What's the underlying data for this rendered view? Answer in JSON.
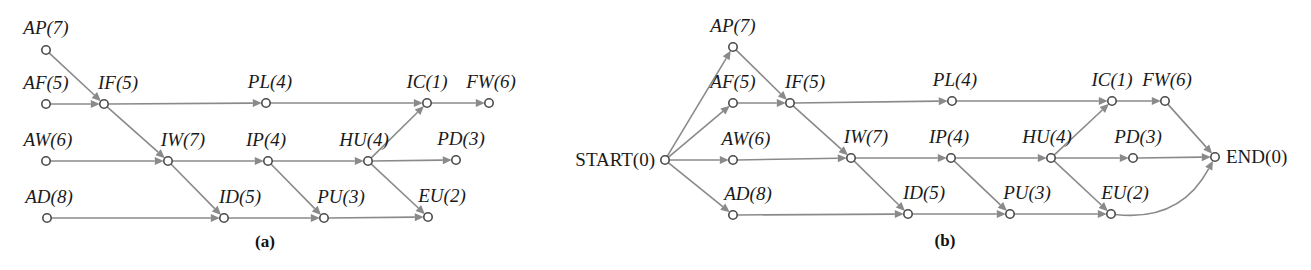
{
  "figure": {
    "background_color": "#ffffff",
    "edge_color": "#8a8a8a",
    "node_stroke_color": "#4a4a4a",
    "text_color": "#1a1a1a"
  },
  "chart_data": {
    "type": "diagram",
    "panels": [
      {
        "caption": "(a)",
        "caption_x": 265,
        "caption_y": 247,
        "nodes": [
          {
            "id": "AP_a",
            "label": "AP(7)",
            "name": "AP",
            "duration": 7,
            "x": 46,
            "y": 50,
            "label_x": 46,
            "label_y": 34,
            "anchor": "middle",
            "italic": true
          },
          {
            "id": "AF_a",
            "label": "AF(5)",
            "name": "AF",
            "duration": 5,
            "x": 46,
            "y": 104,
            "label_x": 46,
            "label_y": 89,
            "anchor": "middle",
            "italic": true
          },
          {
            "id": "IF_a",
            "label": "IF(5)",
            "name": "IF",
            "duration": 5,
            "x": 104,
            "y": 104,
            "label_x": 118,
            "label_y": 89,
            "anchor": "middle",
            "italic": true
          },
          {
            "id": "PL_a",
            "label": "PL(4)",
            "name": "PL",
            "duration": 4,
            "x": 266,
            "y": 103,
            "label_x": 270,
            "label_y": 88,
            "anchor": "middle",
            "italic": true
          },
          {
            "id": "IC_a",
            "label": "IC(1)",
            "name": "IC",
            "duration": 1,
            "x": 427,
            "y": 103,
            "label_x": 427,
            "label_y": 88,
            "anchor": "middle",
            "italic": true
          },
          {
            "id": "FW_a",
            "label": "FW(6)",
            "name": "FW",
            "duration": 6,
            "x": 489,
            "y": 103,
            "label_x": 491,
            "label_y": 88,
            "anchor": "middle",
            "italic": true
          },
          {
            "id": "AW_a",
            "label": "AW(6)",
            "name": "AW",
            "duration": 6,
            "x": 46,
            "y": 161,
            "label_x": 48,
            "label_y": 146,
            "anchor": "middle",
            "italic": true
          },
          {
            "id": "IW_a",
            "label": "IW(7)",
            "name": "IW",
            "duration": 7,
            "x": 168,
            "y": 161,
            "label_x": 183,
            "label_y": 146,
            "anchor": "middle",
            "italic": true
          },
          {
            "id": "IP_a",
            "label": "IP(4)",
            "name": "IP",
            "duration": 4,
            "x": 268,
            "y": 161,
            "label_x": 266,
            "label_y": 146,
            "anchor": "middle",
            "italic": true
          },
          {
            "id": "HU_a",
            "label": "HU(4)",
            "name": "HU",
            "duration": 4,
            "x": 368,
            "y": 161,
            "label_x": 364,
            "label_y": 146,
            "anchor": "middle",
            "italic": true
          },
          {
            "id": "PD_a",
            "label": "PD(3)",
            "name": "PD",
            "duration": 3,
            "x": 456,
            "y": 160,
            "label_x": 461,
            "label_y": 145,
            "anchor": "middle",
            "italic": true
          },
          {
            "id": "AD_a",
            "label": "AD(8)",
            "name": "AD",
            "duration": 8,
            "x": 47,
            "y": 218,
            "label_x": 49,
            "label_y": 203,
            "anchor": "middle",
            "italic": true
          },
          {
            "id": "ID_a",
            "label": "ID(5)",
            "name": "ID",
            "duration": 5,
            "x": 224,
            "y": 218,
            "label_x": 240,
            "label_y": 203,
            "anchor": "middle",
            "italic": true
          },
          {
            "id": "PU_a",
            "label": "PU(3)",
            "name": "PU",
            "duration": 3,
            "x": 324,
            "y": 218,
            "label_x": 341,
            "label_y": 203,
            "anchor": "middle",
            "italic": true
          },
          {
            "id": "EU_a",
            "label": "EU(2)",
            "name": "EU",
            "duration": 2,
            "x": 428,
            "y": 217,
            "label_x": 442,
            "label_y": 202,
            "anchor": "middle",
            "italic": true
          }
        ],
        "edges": [
          {
            "from": "AP_a",
            "to": "IF_a"
          },
          {
            "from": "AF_a",
            "to": "IF_a"
          },
          {
            "from": "IF_a",
            "to": "PL_a"
          },
          {
            "from": "PL_a",
            "to": "IC_a"
          },
          {
            "from": "IC_a",
            "to": "FW_a"
          },
          {
            "from": "IF_a",
            "to": "IW_a"
          },
          {
            "from": "AW_a",
            "to": "IW_a"
          },
          {
            "from": "IW_a",
            "to": "IP_a"
          },
          {
            "from": "IP_a",
            "to": "HU_a"
          },
          {
            "from": "HU_a",
            "to": "PD_a"
          },
          {
            "from": "HU_a",
            "to": "IC_a"
          },
          {
            "from": "IW_a",
            "to": "ID_a"
          },
          {
            "from": "AD_a",
            "to": "ID_a"
          },
          {
            "from": "ID_a",
            "to": "PU_a"
          },
          {
            "from": "IP_a",
            "to": "PU_a"
          },
          {
            "from": "PU_a",
            "to": "EU_a"
          },
          {
            "from": "HU_a",
            "to": "EU_a"
          }
        ]
      },
      {
        "caption": "(b)",
        "caption_x": 945,
        "caption_y": 246,
        "nodes": [
          {
            "id": "START_b",
            "label": "START(0)",
            "name": "START",
            "duration": 0,
            "x": 665,
            "y": 160,
            "label_x": 655,
            "label_y": 166,
            "anchor": "end",
            "italic": false
          },
          {
            "id": "AP_b",
            "label": "AP(7)",
            "name": "AP",
            "duration": 7,
            "x": 733,
            "y": 47,
            "label_x": 733,
            "label_y": 32,
            "anchor": "middle",
            "italic": true
          },
          {
            "id": "AF_b",
            "label": "AF(5)",
            "name": "AF",
            "duration": 5,
            "x": 733,
            "y": 103,
            "label_x": 733,
            "label_y": 88,
            "anchor": "middle",
            "italic": true
          },
          {
            "id": "IF_b",
            "label": "IF(5)",
            "name": "IF",
            "duration": 5,
            "x": 790,
            "y": 103,
            "label_x": 805,
            "label_y": 88,
            "anchor": "middle",
            "italic": true
          },
          {
            "id": "PL_b",
            "label": "PL(4)",
            "name": "PL",
            "duration": 4,
            "x": 952,
            "y": 101,
            "label_x": 955,
            "label_y": 86,
            "anchor": "middle",
            "italic": true
          },
          {
            "id": "IC_b",
            "label": "IC(1)",
            "name": "IC",
            "duration": 1,
            "x": 1112,
            "y": 101,
            "label_x": 1112,
            "label_y": 86,
            "anchor": "middle",
            "italic": true
          },
          {
            "id": "FW_b",
            "label": "FW(6)",
            "name": "FW",
            "duration": 6,
            "x": 1165,
            "y": 101,
            "label_x": 1167,
            "label_y": 86,
            "anchor": "middle",
            "italic": true
          },
          {
            "id": "AW_b",
            "label": "AW(6)",
            "name": "AW",
            "duration": 6,
            "x": 733,
            "y": 160,
            "label_x": 746,
            "label_y": 145,
            "anchor": "middle",
            "italic": true
          },
          {
            "id": "IW_b",
            "label": "IW(7)",
            "name": "IW",
            "duration": 7,
            "x": 851,
            "y": 158,
            "label_x": 866,
            "label_y": 143,
            "anchor": "middle",
            "italic": true
          },
          {
            "id": "IP_b",
            "label": "IP(4)",
            "name": "IP",
            "duration": 4,
            "x": 951,
            "y": 158,
            "label_x": 949,
            "label_y": 143,
            "anchor": "middle",
            "italic": true
          },
          {
            "id": "HU_b",
            "label": "HU(4)",
            "name": "HU",
            "duration": 4,
            "x": 1051,
            "y": 158,
            "label_x": 1047,
            "label_y": 143,
            "anchor": "middle",
            "italic": true
          },
          {
            "id": "PD_b",
            "label": "PD(3)",
            "name": "PD",
            "duration": 3,
            "x": 1133,
            "y": 158,
            "label_x": 1138,
            "label_y": 143,
            "anchor": "middle",
            "italic": true
          },
          {
            "id": "AD_b",
            "label": "AD(8)",
            "name": "AD",
            "duration": 8,
            "x": 733,
            "y": 215,
            "label_x": 748,
            "label_y": 200,
            "anchor": "middle",
            "italic": true
          },
          {
            "id": "ID_b",
            "label": "ID(5)",
            "name": "ID",
            "duration": 5,
            "x": 908,
            "y": 214,
            "label_x": 924,
            "label_y": 199,
            "anchor": "middle",
            "italic": true
          },
          {
            "id": "PU_b",
            "label": "PU(3)",
            "name": "PU",
            "duration": 3,
            "x": 1010,
            "y": 214,
            "label_x": 1027,
            "label_y": 199,
            "anchor": "middle",
            "italic": true
          },
          {
            "id": "EU_b",
            "label": "EU(2)",
            "name": "EU",
            "duration": 2,
            "x": 1111,
            "y": 214,
            "label_x": 1125,
            "label_y": 199,
            "anchor": "middle",
            "italic": true
          },
          {
            "id": "END_b",
            "label": "END(0)",
            "name": "END",
            "duration": 0,
            "x": 1215,
            "y": 157,
            "label_x": 1226,
            "label_y": 163,
            "anchor": "start",
            "italic": false
          }
        ],
        "edges": [
          {
            "from": "START_b",
            "to": "AP_b"
          },
          {
            "from": "START_b",
            "to": "AF_b"
          },
          {
            "from": "START_b",
            "to": "AW_b"
          },
          {
            "from": "START_b",
            "to": "AD_b"
          },
          {
            "from": "AP_b",
            "to": "IF_b"
          },
          {
            "from": "AF_b",
            "to": "IF_b"
          },
          {
            "from": "IF_b",
            "to": "PL_b"
          },
          {
            "from": "PL_b",
            "to": "IC_b"
          },
          {
            "from": "IC_b",
            "to": "FW_b"
          },
          {
            "from": "FW_b",
            "to": "END_b"
          },
          {
            "from": "IF_b",
            "to": "IW_b"
          },
          {
            "from": "AW_b",
            "to": "IW_b"
          },
          {
            "from": "IW_b",
            "to": "IP_b"
          },
          {
            "from": "IP_b",
            "to": "HU_b"
          },
          {
            "from": "HU_b",
            "to": "PD_b"
          },
          {
            "from": "HU_b",
            "to": "IC_b"
          },
          {
            "from": "PD_b",
            "to": "END_b"
          },
          {
            "from": "IW_b",
            "to": "ID_b"
          },
          {
            "from": "AD_b",
            "to": "ID_b"
          },
          {
            "from": "ID_b",
            "to": "PU_b"
          },
          {
            "from": "IP_b",
            "to": "PU_b"
          },
          {
            "from": "PU_b",
            "to": "EU_b"
          },
          {
            "from": "HU_b",
            "to": "EU_b"
          },
          {
            "from": "EU_b",
            "to": "END_b",
            "curve": {
              "cx": 1180,
              "cy": 222
            }
          }
        ]
      }
    ]
  }
}
